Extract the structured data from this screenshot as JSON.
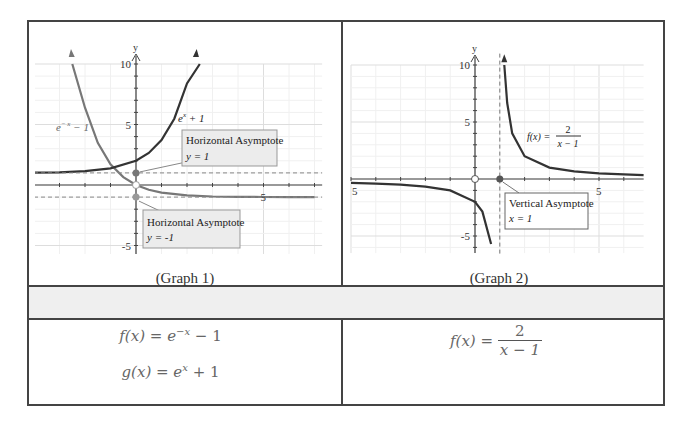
{
  "table": {
    "captions": [
      "(Graph 1)",
      "(Graph 2)"
    ],
    "formulas": {
      "graph1": [
        {
          "lhs": "f(x) = ",
          "base": "e",
          "exp": "−x",
          "rest": " − 1"
        },
        {
          "lhs": "g(x) = ",
          "base": "e",
          "exp": "x",
          "rest": " + 1"
        }
      ],
      "graph2": {
        "lhs": "f(x) = ",
        "num": "2",
        "den": "x − 1"
      }
    }
  },
  "chart_data": [
    {
      "type": "line",
      "title": "Graph 1",
      "xlabel": "",
      "ylabel": "y",
      "xlim": [
        -4,
        7.3
      ],
      "ylim": [
        -6,
        11.5
      ],
      "grid": true,
      "y_tick_labels": [
        "10",
        "5",
        "-5"
      ],
      "x_tick_labels": [
        "5"
      ],
      "series": [
        {
          "name": "e^-x - 1",
          "label": "e^-x − 1",
          "x": [
            -2.5,
            -2,
            -1.5,
            -1,
            -0.5,
            0,
            0.5,
            1,
            2,
            3,
            4,
            5,
            6,
            7
          ],
          "y": [
            11.18,
            6.39,
            3.48,
            1.72,
            0.65,
            0,
            -0.39,
            -0.63,
            -0.86,
            -0.95,
            -0.98,
            -0.99,
            -1,
            -1
          ]
        },
        {
          "name": "e^x + 1",
          "label": "eˣ + 1",
          "x": [
            -4,
            -3,
            -2,
            -1,
            0,
            0.5,
            1,
            1.5,
            2,
            2.5
          ],
          "y": [
            1.02,
            1.05,
            1.14,
            1.37,
            2,
            2.65,
            3.72,
            5.48,
            8.39,
            13.18
          ]
        }
      ],
      "annotations": [
        {
          "title": "Horizontal Asymptote",
          "eq": "y  =  1",
          "y": 1
        },
        {
          "title": "Horizontal Asymptote",
          "eq": "y  =  -1",
          "y": -1
        }
      ],
      "series_labels": {
        "f": "e",
        "f_exp": "− x",
        "f_rest": " − 1",
        "g": "e",
        "g_exp": "x",
        "g_rest": " + 1"
      }
    },
    {
      "type": "line",
      "title": "Graph 2",
      "xlabel": "",
      "ylabel": "y",
      "xlim": [
        -5,
        6.8
      ],
      "ylim": [
        -6.5,
        11.5
      ],
      "grid": true,
      "y_tick_labels": [
        "10",
        "5",
        "-5"
      ],
      "x_tick_labels": [
        "5",
        "5"
      ],
      "series": [
        {
          "name": "2/(x-1)",
          "x": [
            -5,
            -4,
            -3,
            -2,
            -1,
            0,
            0.3,
            0.65
          ],
          "y": [
            -0.33,
            -0.4,
            -0.5,
            -0.67,
            -1,
            -2,
            -2.86,
            -5.7
          ]
        },
        {
          "name": "2/(x-1) right",
          "x": [
            1.18,
            1.3,
            1.5,
            2,
            3,
            4,
            5,
            6,
            6.8
          ],
          "y": [
            11,
            6.67,
            4,
            2,
            1,
            0.67,
            0.5,
            0.4,
            0.34
          ]
        }
      ],
      "annotations": [
        {
          "title": "Vertical Asymptote",
          "eq": "x  =  1",
          "x": 1
        }
      ],
      "curve_label": {
        "lhs": "f(x) =",
        "num": "2",
        "den": "x − 1"
      }
    }
  ]
}
